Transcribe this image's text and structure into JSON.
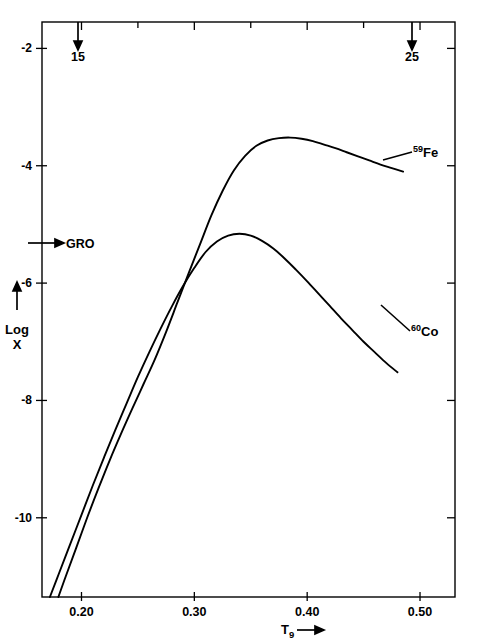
{
  "figure": {
    "background_color": "#ffffff",
    "line_color": "#000000",
    "width": 477,
    "height": 643
  },
  "chart_data": {
    "type": "line",
    "title": "",
    "subtitle": "",
    "xlabel": "T9",
    "xlabel_display": "T₉ ⟶",
    "ylabel": "Log X",
    "ylabel_display": "Log X",
    "xlim": [
      0.165,
      0.531
    ],
    "ylim": [
      -11.35,
      -1.55
    ],
    "x_ticks": [
      0.2,
      0.3,
      0.4,
      0.5
    ],
    "x_tick_labels": [
      "0.20",
      "0.30",
      "0.40",
      "0.50"
    ],
    "x_minor_ticks": [
      0.25,
      0.35,
      0.45
    ],
    "y_ticks": [
      -2,
      -4,
      -6,
      -8,
      -10
    ],
    "y_tick_labels": [
      "-2",
      "-4",
      "-6",
      "-8",
      "-10"
    ],
    "grid": false,
    "legend_position": "inline-right",
    "frame": "box",
    "series": [
      {
        "name": "59Fe",
        "label_sup": "59",
        "label_base": "Fe",
        "color": "#000000",
        "x": [
          0.1795,
          0.186,
          0.195,
          0.205,
          0.215,
          0.225,
          0.235,
          0.245,
          0.255,
          0.265,
          0.275,
          0.285,
          0.295,
          0.305,
          0.315,
          0.325,
          0.335,
          0.345,
          0.355,
          0.365,
          0.375,
          0.385,
          0.395,
          0.405,
          0.415,
          0.425,
          0.435,
          0.445,
          0.455,
          0.465,
          0.475,
          0.485
        ],
        "y": [
          -11.35,
          -11.0,
          -10.53,
          -10.0,
          -9.5,
          -9.02,
          -8.57,
          -8.14,
          -7.72,
          -7.3,
          -6.83,
          -6.33,
          -5.83,
          -5.34,
          -4.85,
          -4.43,
          -4.08,
          -3.83,
          -3.66,
          -3.57,
          -3.53,
          -3.52,
          -3.54,
          -3.58,
          -3.64,
          -3.7,
          -3.77,
          -3.84,
          -3.91,
          -3.98,
          -4.04,
          -4.1
        ]
      },
      {
        "name": "60Co",
        "label_sup": "60",
        "label_base": "Co",
        "color": "#000000",
        "x": [
          0.172,
          0.18,
          0.19,
          0.2,
          0.21,
          0.22,
          0.23,
          0.24,
          0.25,
          0.26,
          0.27,
          0.28,
          0.29,
          0.3,
          0.31,
          0.32,
          0.33,
          0.34,
          0.35,
          0.36,
          0.37,
          0.38,
          0.39,
          0.4,
          0.41,
          0.42,
          0.43,
          0.44,
          0.45,
          0.46,
          0.47,
          0.48
        ],
        "y": [
          -11.35,
          -10.95,
          -10.45,
          -9.95,
          -9.45,
          -8.97,
          -8.5,
          -8.05,
          -7.6,
          -7.18,
          -6.78,
          -6.4,
          -6.05,
          -5.74,
          -5.47,
          -5.29,
          -5.19,
          -5.16,
          -5.19,
          -5.28,
          -5.41,
          -5.58,
          -5.77,
          -5.97,
          -6.18,
          -6.39,
          -6.6,
          -6.8,
          -7.0,
          -7.18,
          -7.36,
          -7.52
        ]
      }
    ],
    "annotations": [
      {
        "name": "gro-marker",
        "text": "GRO",
        "kind": "left-arrow",
        "axis": "y",
        "value": -5.45
      },
      {
        "name": "top-arrow-15",
        "text": "15",
        "kind": "down-arrow",
        "axis": "x",
        "value": 0.1995
      },
      {
        "name": "top-arrow-25",
        "text": "25",
        "kind": "down-arrow",
        "axis": "x",
        "value": 0.4945
      }
    ]
  },
  "labels": {
    "y_axis_arrow": "↑",
    "y_axis_title_line1": "Log",
    "y_axis_title_line2": "X",
    "x_axis_title_base": "T",
    "x_axis_title_sub": "9",
    "x_axis_title_arrow": "⟶"
  }
}
